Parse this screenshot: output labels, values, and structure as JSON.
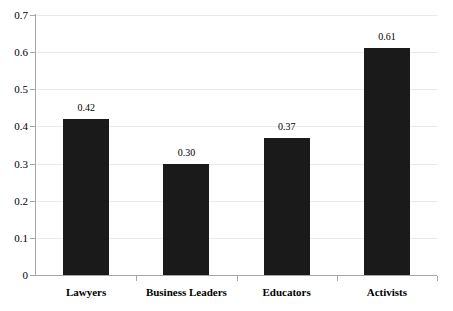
{
  "chart_data": {
    "type": "bar",
    "title": "",
    "subtitle": "",
    "xlabel": "",
    "ylabel": "",
    "categories": [
      "Lawyers",
      "Business Leaders",
      "Educators",
      "Activists"
    ],
    "values": [
      0.42,
      0.3,
      0.37,
      0.61
    ],
    "data_labels": [
      "0.42",
      "0.30",
      "0.37",
      "0.61"
    ],
    "ylim": [
      0,
      0.7
    ],
    "ytick_values": [
      0.7,
      0.6,
      0.5,
      0.4,
      0.3,
      0.2,
      0.1,
      0
    ],
    "ytick_labels": [
      "0.7",
      "0.6",
      "0.5",
      "0.4",
      "0.3",
      "0.2",
      "0.1",
      "0"
    ],
    "grid": true,
    "grid_orientation": "horizontal",
    "legend": null,
    "legend_position": "none",
    "bar_color": "#1a1a1a",
    "gridline_color": "#e8eaec",
    "axis_color": "#a6a6a6",
    "background_color": "#ffffff"
  }
}
